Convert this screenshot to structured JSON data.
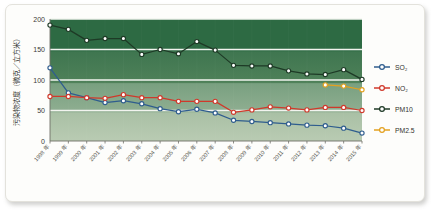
{
  "chart_data": {
    "type": "line",
    "title": "",
    "xlabel": "",
    "ylabel": "污染物浓度（微克／立方米）",
    "ylim": [
      0,
      200
    ],
    "yticks": [
      0,
      50,
      100,
      150,
      200
    ],
    "ytick_labels": [
      "0",
      "50",
      "100",
      "150",
      "200"
    ],
    "grid": true,
    "legend_position": "right",
    "categories": [
      "1998 年",
      "1999 年",
      "2000 年",
      "2001 年",
      "2002 年",
      "2003 年",
      "2004 年",
      "2005 年",
      "2006 年",
      "2007 年",
      "2008 年",
      "2009 年",
      "2010 年",
      "2011 年",
      "2012 年",
      "2013 年",
      "2014 年",
      "2015 年"
    ],
    "series": [
      {
        "name": "SO₂",
        "color": "#2f5d8e",
        "marker": "circle-open",
        "values": [
          120,
          79,
          71,
          63,
          66,
          61,
          53,
          48,
          52,
          46,
          34,
          32,
          30,
          28,
          26,
          25,
          21,
          13
        ]
      },
      {
        "name": "NO₂",
        "color": "#d0392b",
        "marker": "circle-open",
        "values": [
          73,
          73,
          71,
          70,
          76,
          71,
          71,
          65,
          65,
          65,
          47,
          51,
          56,
          54,
          51,
          55,
          55,
          50
        ]
      },
      {
        "name": "PM10",
        "color": "#1e3a26",
        "marker": "circle-open",
        "values": [
          190,
          183,
          165,
          168,
          168,
          142,
          150,
          143,
          163,
          149,
          124,
          123,
          123,
          115,
          110,
          109,
          117,
          101
        ]
      },
      {
        "name": "PM2.5",
        "color": "#e3a11f",
        "marker": "circle-open",
        "values": [
          null,
          null,
          null,
          null,
          null,
          null,
          null,
          null,
          null,
          null,
          null,
          null,
          null,
          null,
          null,
          92,
          90,
          84
        ]
      }
    ]
  },
  "legend": {
    "entries": [
      {
        "label": "SO₂",
        "color": "#2f5d8e"
      },
      {
        "label": "NO₂",
        "color": "#d0392b"
      },
      {
        "label": "PM10",
        "color": "#1e3a26"
      },
      {
        "label": "PM2.5",
        "color": "#e3a11f"
      }
    ]
  },
  "colors": {
    "band_top": "#2e6b45",
    "band_2": "#477c56",
    "band_3": "#7ba182",
    "band_bottom": "#a9c0a5",
    "gridline": "#f2f4ef",
    "page_background": "#ffffff",
    "card_background": "#fdfdfb"
  }
}
